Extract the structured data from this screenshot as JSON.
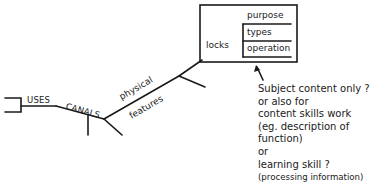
{
  "diagram": {
    "nodes": {
      "uses": "USES",
      "canals": "CANALS",
      "physical": "physical",
      "features": "features",
      "locks": "locks"
    },
    "box": {
      "items": [
        "purpose",
        "types",
        "operation"
      ]
    },
    "annotation": {
      "lines": [
        "Subject content only ?",
        "or also for",
        "content skills work",
        "(eg. description of",
        "function)",
        "or",
        "learning skill ?",
        "(processing information)"
      ]
    },
    "colors": {
      "ink": "#1a1a1a",
      "background": "#ffffff"
    }
  }
}
